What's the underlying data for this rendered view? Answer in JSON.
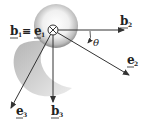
{
  "diagram": {
    "labels": {
      "b1_eq_e1": "b₁ ≡ e₁",
      "b1": "b",
      "b1_sub": "1",
      "equiv": "≡",
      "e1": "e",
      "e1_sub": "1",
      "b2": "b",
      "b2_sub": "2",
      "e2": "e",
      "e2_sub": "2",
      "b3": "b",
      "b3_sub": "3",
      "e3": "e",
      "e3_sub": "3",
      "theta": "θ"
    },
    "origin_symbol": "into-page-icon",
    "colors": {
      "line": "#333333",
      "sphere_light": "#f2f2f2",
      "sphere_dark": "#8a8a8a",
      "blade": "#b8b8b8"
    }
  }
}
